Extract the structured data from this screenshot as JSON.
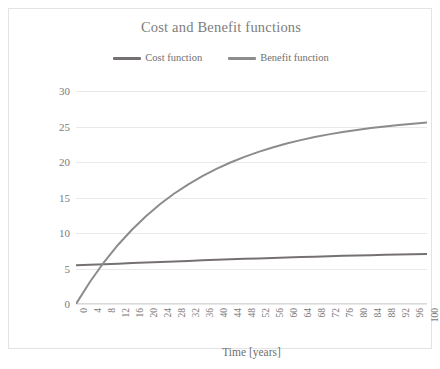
{
  "chart_data": {
    "type": "line",
    "title": "Cost and Benefit functions",
    "xlabel": "Time [years]",
    "ylabel": "Costs and benefits actualized and cumulated [M€]",
    "xlim": [
      0,
      100
    ],
    "ylim": [
      0,
      30
    ],
    "xticks": [
      0,
      4,
      8,
      12,
      16,
      20,
      24,
      28,
      32,
      36,
      40,
      44,
      48,
      52,
      56,
      60,
      64,
      68,
      72,
      76,
      80,
      84,
      88,
      92,
      96,
      100
    ],
    "yticks": [
      0,
      5,
      10,
      15,
      20,
      25,
      30
    ],
    "grid": "horizontal",
    "legend_position": "top-center",
    "x": [
      0,
      4,
      8,
      12,
      16,
      20,
      24,
      28,
      32,
      36,
      40,
      44,
      48,
      52,
      56,
      60,
      64,
      68,
      72,
      76,
      80,
      84,
      88,
      92,
      96,
      100
    ],
    "series": [
      {
        "name": "Cost function",
        "color": "#767171",
        "values": [
          5.45,
          5.52,
          5.6,
          5.68,
          5.76,
          5.84,
          5.92,
          6.0,
          6.07,
          6.15,
          6.22,
          6.29,
          6.36,
          6.42,
          6.49,
          6.55,
          6.61,
          6.67,
          6.72,
          6.78,
          6.83,
          6.88,
          6.93,
          6.97,
          7.01,
          7.05
        ]
      },
      {
        "name": "Benefit function",
        "color": "#8c8c8c",
        "values": [
          0.0,
          3.14,
          5.91,
          8.35,
          10.5,
          12.4,
          14.08,
          15.56,
          16.86,
          18.02,
          19.03,
          19.93,
          20.73,
          21.43,
          22.05,
          22.6,
          23.08,
          23.51,
          23.89,
          24.22,
          24.52,
          24.78,
          25.01,
          25.21,
          25.39,
          25.55
        ]
      }
    ],
    "annotations": [
      {
        "text": "crossover",
        "x": 9.5,
        "y": 5.6
      }
    ]
  },
  "legend": {
    "items": [
      {
        "label": "Cost function",
        "icon": "line-swatch"
      },
      {
        "label": "Benefit function",
        "icon": "line-swatch"
      }
    ]
  },
  "colors": {
    "cost": "#767171",
    "benefit": "#8c8c8c",
    "grid": "#e9e9e9",
    "text": "#7a7a7a",
    "title": "#7d7d7d",
    "border": "#e3e3e3"
  }
}
